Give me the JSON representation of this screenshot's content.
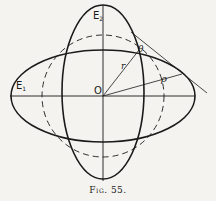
{
  "figure": {
    "caption": "Fig. 55.",
    "labels": {
      "E1": "E",
      "E1_sub": "1",
      "E2": "E",
      "E2_sub": "2",
      "origin": "O",
      "radius": "r",
      "angle": "θ",
      "rho": "ρ"
    },
    "colors": {
      "ink": "#1a1a1a",
      "paper": "#f4f3ef"
    }
  }
}
